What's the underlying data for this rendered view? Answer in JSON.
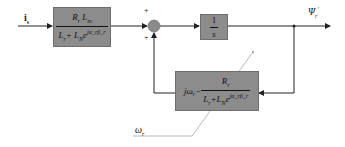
{
  "diagram": {
    "input_label": "i",
    "input_sub": "s",
    "output_label": "Ψ",
    "output_sub": "r",
    "output_sup": "'",
    "speed_label": "ω",
    "speed_sub": "r",
    "sum_signs": [
      "+",
      "+"
    ],
    "block1": {
      "numerator": "R_r L_m",
      "num_a": "R",
      "num_a_sub": "r",
      "num_b": " L",
      "num_b_sub": "m",
      "den_a": "L",
      "den_a_sub": "r",
      "den_b": "+ L",
      "den_b_sub": "N",
      "den_c": "e",
      "den_c_sup": "jα_rβ_r"
    },
    "block2": {
      "numerator": "1",
      "denominator": "s"
    },
    "block3": {
      "prefix": "jω",
      "prefix_sub": "r",
      "minus": " − ",
      "num_a": "R",
      "num_a_sub": "r",
      "den_a": "L",
      "den_a_sub": "r",
      "den_b": "+L",
      "den_b_sub": "N",
      "den_c": "e",
      "den_c_sup": "jα_rβ_r"
    },
    "colors": {
      "block_fill": "#8c8c8c",
      "line": "#222222",
      "sum_fill": "#8a8a8a"
    }
  }
}
